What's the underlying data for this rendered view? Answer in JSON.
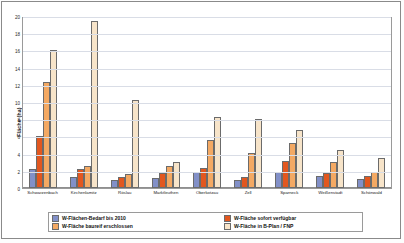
{
  "chart_data": {
    "type": "bar",
    "title": "",
    "xlabel": "",
    "ylabel": "Fläche (ha)",
    "ylim": [
      0,
      20
    ],
    "yticks": [
      0,
      2,
      4,
      6,
      8,
      10,
      12,
      14,
      16,
      18,
      20
    ],
    "grid": true,
    "legend_position": "bottom",
    "categories": [
      "Schwarzenbach",
      "Kirchenlamitz",
      "Röslau",
      "Marktleuthen",
      "Oberkotzau",
      "Zell",
      "Sparneck",
      "Weißenstadt",
      "Schönwald"
    ],
    "series": [
      {
        "name": "W-Flächen-Bedarf bis 2010",
        "color": "#8290c8",
        "values": [
          2.2,
          1.3,
          0.9,
          1.2,
          1.9,
          0.9,
          1.9,
          1.4,
          1.1
        ]
      },
      {
        "name": "W-Fläche sofort verfügbar",
        "color": "#e2571f",
        "values": [
          6.1,
          2.2,
          1.3,
          1.7,
          2.3,
          1.3,
          3.2,
          1.7,
          1.4
        ]
      },
      {
        "name": "W-Fläche baureif erschlossen",
        "color": "#f4a963",
        "values": [
          12.4,
          2.6,
          1.6,
          2.6,
          5.6,
          4.1,
          5.3,
          3.0,
          1.9
        ]
      },
      {
        "name": "W-Fläche in B-Plan / FNP",
        "color": "#f7e4c9",
        "values": [
          16.1,
          19.5,
          10.3,
          3.1,
          8.3,
          8.1,
          6.8,
          4.4,
          3.5
        ]
      }
    ]
  },
  "legend": {
    "items": [
      "W-Flächen-Bedarf bis 2010",
      "W-Fläche sofort verfügbar",
      "W-Fläche baureif erschlossen",
      "W-Fläche in B-Plan / FNP"
    ]
  }
}
